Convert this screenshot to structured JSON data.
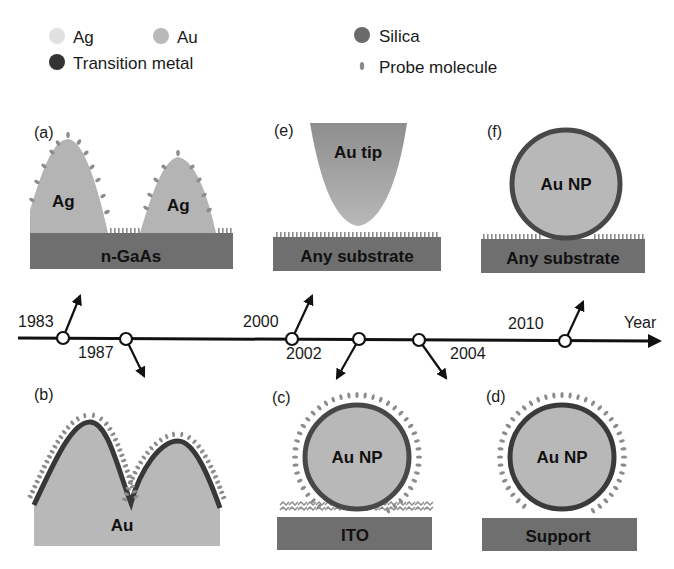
{
  "legend": [
    {
      "label": "Ag",
      "color": "#e0e0e0"
    },
    {
      "label": "Au",
      "color": "#b9b9b9"
    },
    {
      "label": "Transition metal",
      "color": "#333333"
    },
    {
      "label": "Silica",
      "color": "#6a6a6a"
    },
    {
      "label": "Probe molecule",
      "color": "#8a8a8a"
    }
  ],
  "colors": {
    "substrate": "#6f6f6f",
    "metal": "#b4b4b4",
    "shell": "#454545",
    "probe": "#8c8c8c",
    "axis": "#111111"
  },
  "timeline": {
    "axis_label": "Year",
    "events": [
      {
        "year": "1983",
        "panel": "a",
        "direction": "up"
      },
      {
        "year": "1987",
        "panel": "b",
        "direction": "down"
      },
      {
        "year": "2000",
        "panel": "e",
        "direction": "up"
      },
      {
        "year": "2002",
        "panel": "c",
        "direction": "down"
      },
      {
        "year": "2004",
        "panel": "d",
        "direction": "down"
      },
      {
        "year": "2010",
        "panel": "f",
        "direction": "up"
      }
    ]
  },
  "panels": {
    "a": {
      "tag": "(a)",
      "particle_labels": [
        "Ag",
        "Ag"
      ],
      "substrate": "n-GaAs"
    },
    "b": {
      "tag": "(b)",
      "substrate": "Au"
    },
    "c": {
      "tag": "(c)",
      "particle": "Au NP",
      "substrate": "ITO"
    },
    "d": {
      "tag": "(d)",
      "particle": "Au NP",
      "substrate": "Support"
    },
    "e": {
      "tag": "(e)",
      "particle": "Au tip",
      "substrate": "Any substrate"
    },
    "f": {
      "tag": "(f)",
      "particle": "Au NP",
      "substrate": "Any substrate"
    }
  }
}
